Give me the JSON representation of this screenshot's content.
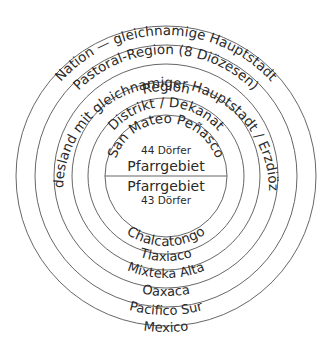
{
  "diagram": {
    "center": [
      166,
      176
    ],
    "rings": [
      {
        "radius": 150,
        "top_label": "Nation — gleichnamige Hauptstadt",
        "bottom_label": "Mexico"
      },
      {
        "radius": 131,
        "top_label": "Pastoral-Region (8 Diözesen)",
        "bottom_label": "Pacifico Sur"
      },
      {
        "radius": 112,
        "top_label": "Bundesland mit gleichnamiger Hauptstadt / Erzdiözese",
        "bottom_label": "Oaxaca"
      },
      {
        "radius": 94,
        "top_label": "Region",
        "bottom_label": "Mixteka Alta"
      },
      {
        "radius": 78,
        "top_label": "Distrikt / Dekanat",
        "bottom_label": "Tlaxiaco"
      },
      {
        "radius": 61,
        "top_label": "San Mateo Peñasco",
        "bottom_label": "Chalcatongo"
      }
    ],
    "upper_half": {
      "title": "Pfarrgebiet",
      "count": "44 Dörfer"
    },
    "lower_half": {
      "title": "Pfarrgebiet",
      "count": "43 Dörfer"
    },
    "stroke_color": "#555555",
    "text_color": "#2a2a2a"
  }
}
